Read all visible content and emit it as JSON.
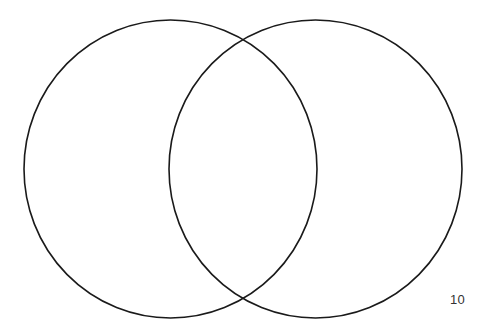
{
  "diagram": {
    "type": "venn",
    "sets": [
      {
        "name": "left-circle",
        "label": "",
        "cx": 170.5,
        "cy": 169,
        "rx": 146.5,
        "ry": 149
      },
      {
        "name": "right-circle",
        "label": "",
        "cx": 315.5,
        "cy": 169,
        "rx": 146.5,
        "ry": 149
      }
    ],
    "stroke_color": "#1a1a1a",
    "stroke_width": 1.6,
    "background": "#ffffff"
  },
  "page": {
    "number": "10"
  }
}
